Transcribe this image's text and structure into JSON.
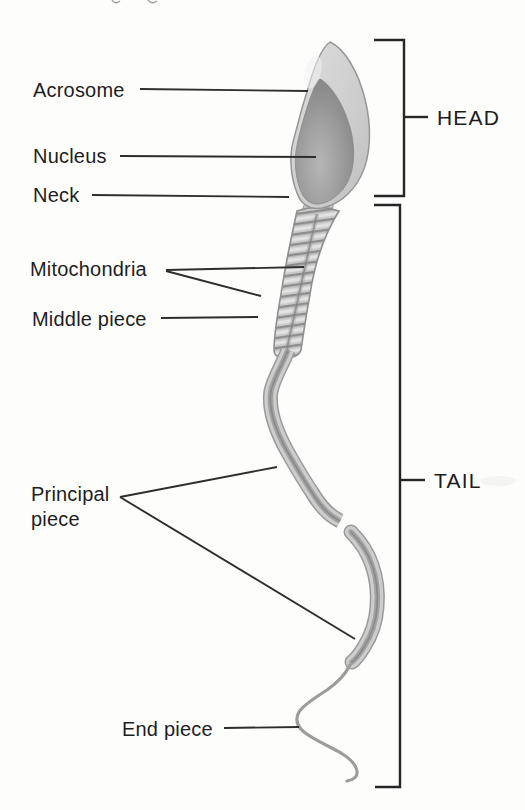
{
  "figure": {
    "name": "sperm-cell-structure-diagram",
    "labels": {
      "acrosome": "Acrosome",
      "nucleus": "Nucleus",
      "neck": "Neck",
      "mitochondria": "Mitochondria",
      "middle_piece": "Middle piece",
      "principal_piece_line1": "Principal",
      "principal_piece_line2": "piece",
      "end_piece": "End piece"
    },
    "brackets": {
      "head": "HEAD",
      "tail": "TAIL"
    },
    "colors": {
      "background": "#fdfdfc",
      "line": "#2e2e2e",
      "text": "#1e1e1e",
      "illustration_light": "#d6d6d6",
      "illustration_mid": "#bdbdbd",
      "illustration_dark": "#878787"
    }
  }
}
